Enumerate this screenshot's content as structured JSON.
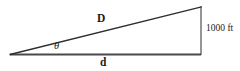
{
  "figure": {
    "type": "geometry-diagram",
    "shape": "right-triangle",
    "background_color": "#ffffff",
    "stroke_color": "#3a3a3a",
    "text_color": "#1b1b1b",
    "labels": {
      "hypotenuse": "D",
      "base": "d",
      "angle": "θ",
      "height": "1000 ft"
    },
    "geometry": {
      "left_vertex": [
        10,
        54.5
      ],
      "top_vertex": [
        201,
        7
      ],
      "right_vertex": [
        201,
        54.5
      ],
      "base_stroke_width": 2.0,
      "hypotenuse_stroke_width": 1.3,
      "vertical_stroke_width": 1.1
    }
  }
}
